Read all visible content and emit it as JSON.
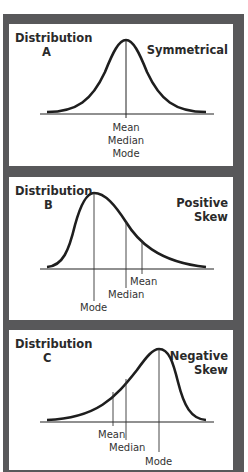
{
  "panels": [
    {
      "title_line1": "Distribution",
      "title_line2": "A",
      "type_line1": "Symmetrical",
      "type_line2": "",
      "labels": [
        "Mean",
        "Median",
        "Mode"
      ]
    },
    {
      "title_line1": "Distribution",
      "title_line2": "B",
      "type_line1": "Positive",
      "type_line2": "Skew",
      "labels": {
        "mean": "Mean",
        "median": "Median",
        "mode": "Mode"
      }
    },
    {
      "title_line1": "Distribution",
      "title_line2": "C",
      "type_line1": "Negative",
      "type_line2": "Skew",
      "labels": {
        "mean": "Mean",
        "median": "Median",
        "mode": "Mode"
      }
    }
  ],
  "colors": {
    "frame": "#58585a",
    "curve": "#1e1e1e",
    "background": "#ffffff"
  }
}
